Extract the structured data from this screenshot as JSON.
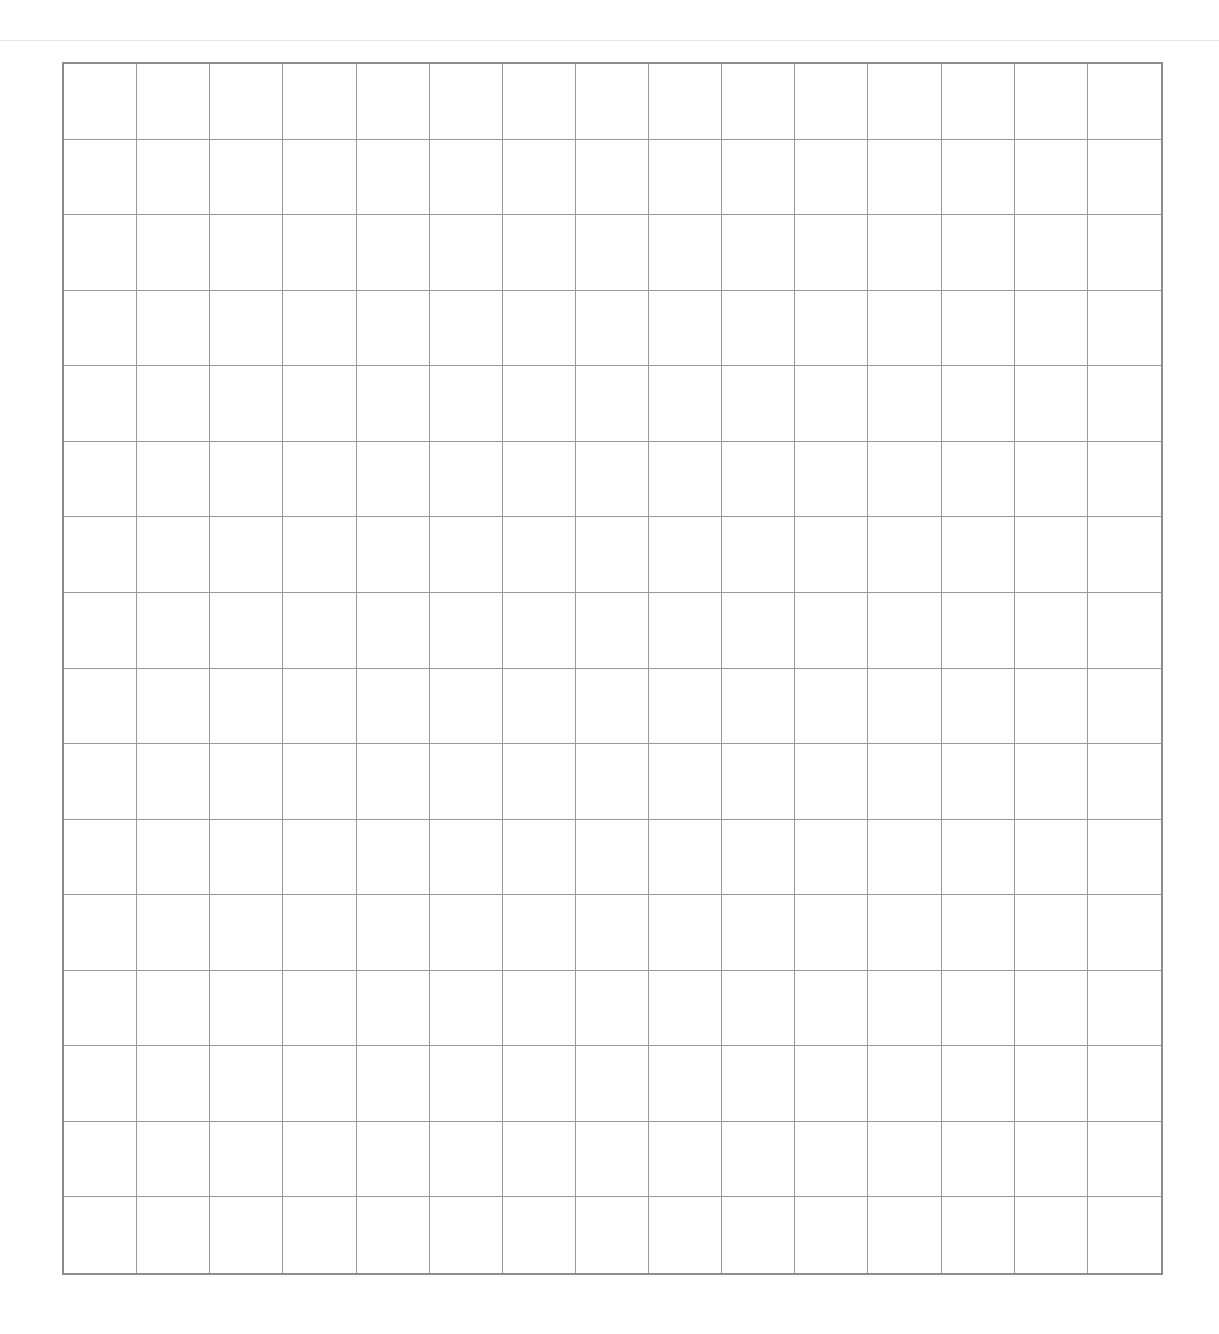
{
  "page": {
    "background": "#ffffff",
    "header_rule_color": "#e6e6e6"
  },
  "grid": {
    "columns": 15,
    "rows": 16,
    "line_color": "#9a9a9a",
    "border_color": "#8c8c8c",
    "cells_filled": []
  }
}
